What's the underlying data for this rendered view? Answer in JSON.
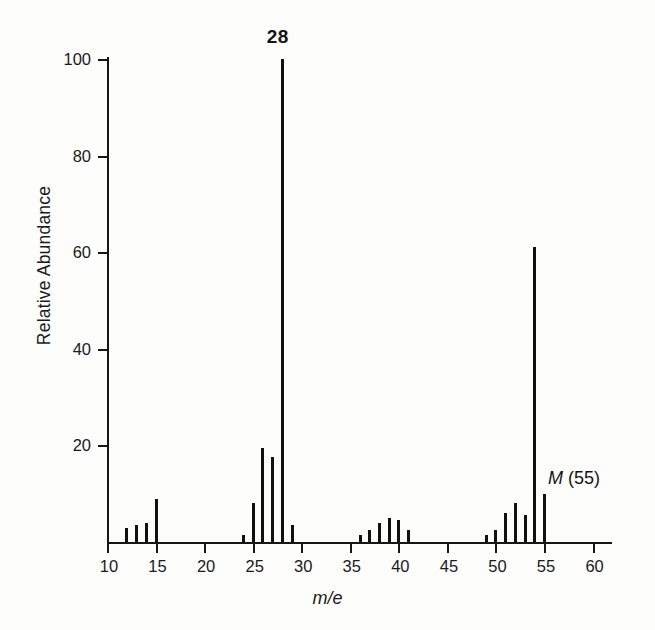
{
  "chart_data": {
    "type": "bar",
    "title": "",
    "xlabel": "m/e",
    "ylabel": "Relative Abundance",
    "xlim": [
      10,
      62
    ],
    "ylim": [
      0,
      100
    ],
    "grid": false,
    "legend": "none",
    "x_ticks": [
      10,
      15,
      20,
      25,
      30,
      35,
      40,
      45,
      50,
      55,
      60
    ],
    "x_minor_tick_step": 1,
    "y_ticks": [
      20,
      40,
      60,
      80,
      100
    ],
    "x": [
      12,
      13,
      14,
      15,
      24,
      25,
      26,
      27,
      28,
      29,
      36,
      37,
      38,
      39,
      40,
      41,
      49,
      50,
      51,
      52,
      53,
      54,
      55
    ],
    "values": [
      3,
      3.5,
      4,
      9,
      1.5,
      8,
      19.5,
      17.5,
      100,
      3.5,
      1.5,
      2.5,
      4,
      5,
      4.5,
      2.5,
      1.5,
      2.5,
      6,
      8,
      5.5,
      61,
      10
    ],
    "annotations": [
      {
        "name": "base-peak",
        "text": "28",
        "x": 28,
        "y": 100
      },
      {
        "name": "molecular-ion",
        "text_italic": "M",
        "text_rest": " (55)",
        "x": 55,
        "y": 10
      }
    ]
  }
}
